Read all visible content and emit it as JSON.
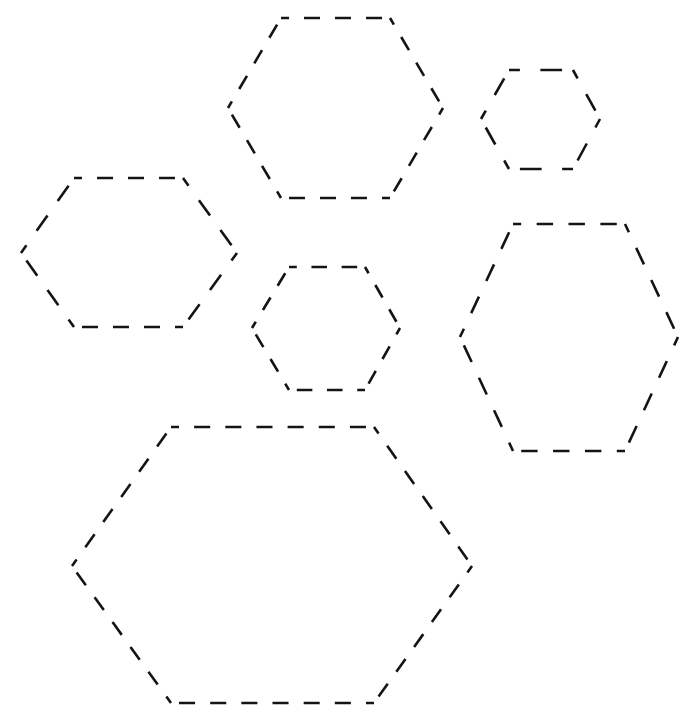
{
  "canvas": {
    "width": 688,
    "height": 720,
    "background": "#ffffff"
  },
  "style": {
    "stroke_color": "#141414",
    "stroke_width": 2.6,
    "dash": 17,
    "gap": 16
  },
  "shapes": [
    {
      "id": "hexagon-top-center",
      "type": "hexagon",
      "outline": "dashed",
      "points": [
        [
          281,
          18
        ],
        [
          390,
          18
        ],
        [
          443,
          108
        ],
        [
          390,
          198
        ],
        [
          281,
          198
        ],
        [
          228,
          108
        ]
      ]
    },
    {
      "id": "hexagon-top-right-small",
      "type": "hexagon",
      "outline": "dashed",
      "points": [
        [
          509,
          70
        ],
        [
          573,
          70
        ],
        [
          600,
          119
        ],
        [
          573,
          169
        ],
        [
          509,
          169
        ],
        [
          481,
          119
        ]
      ]
    },
    {
      "id": "hexagon-middle-left",
      "type": "hexagon",
      "outline": "dashed",
      "points": [
        [
          74,
          178
        ],
        [
          183,
          178
        ],
        [
          237,
          253
        ],
        [
          183,
          327
        ],
        [
          74,
          327
        ],
        [
          21,
          253
        ]
      ]
    },
    {
      "id": "hexagon-center-small",
      "type": "hexagon",
      "outline": "dashed",
      "points": [
        [
          289,
          267
        ],
        [
          365,
          267
        ],
        [
          400,
          328
        ],
        [
          365,
          390
        ],
        [
          289,
          390
        ],
        [
          252,
          328
        ]
      ]
    },
    {
      "id": "hexagon-right-tall",
      "type": "hexagon",
      "outline": "dashed",
      "points": [
        [
          513,
          224
        ],
        [
          625,
          224
        ],
        [
          678,
          337
        ],
        [
          625,
          451
        ],
        [
          513,
          451
        ],
        [
          460,
          337
        ]
      ]
    },
    {
      "id": "hexagon-bottom-large",
      "type": "hexagon",
      "outline": "dashed",
      "points": [
        [
          171,
          427
        ],
        [
          374,
          427
        ],
        [
          472,
          566
        ],
        [
          374,
          703
        ],
        [
          171,
          703
        ],
        [
          72,
          566
        ]
      ]
    }
  ]
}
